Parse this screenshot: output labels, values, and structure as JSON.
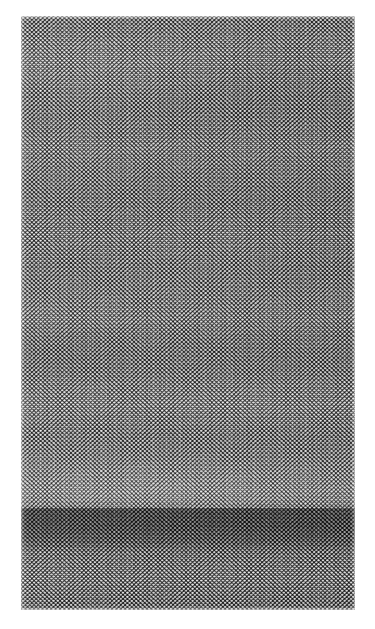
{
  "page": {
    "background_color": "#ffffff",
    "width": 375,
    "height": 629
  },
  "image_plate": {
    "name": "mesh-fabric-texture",
    "description": "Grayscale photographic scan of a dense woven mesh / netting fabric",
    "subject": "woven mesh netting",
    "color_mode": "grayscale",
    "bounds": {
      "x": 21,
      "y": 16,
      "width": 334,
      "height": 594
    },
    "margins": {
      "left": 21,
      "top": 16,
      "right": 20,
      "bottom": 19
    },
    "palette": {
      "thread_dark": "#3a3a3a",
      "cell_light": "#e8e8e8",
      "mid_tone": "#8e8e8e",
      "shadow_band": "#5a5a5a",
      "paper": "#ffffff"
    },
    "texture": {
      "pattern": "staggered circular cells on crossing thread lattice",
      "cell_pitch_px": 4.35,
      "cell_diameter_px": 3.4,
      "rows_estimate": 147,
      "columns_estimate": 77,
      "weave_angle_deg": 68
    },
    "tonal_regions": [
      {
        "name": "upper-field",
        "y_start": 16,
        "y_end": 470,
        "tone": "mid-gray",
        "note": "even mid-gray with faint horizontal banding"
      },
      {
        "name": "bright-band",
        "y_start": 470,
        "y_end": 508,
        "tone": "light",
        "note": "highlight across full width"
      },
      {
        "name": "shadow-step",
        "y_start": 508,
        "y_end": 552,
        "tone": "dark",
        "note": "abrupt darker horizontal band"
      },
      {
        "name": "lower-field",
        "y_start": 552,
        "y_end": 610,
        "tone": "mid-dark",
        "note": "slightly lighter than shadow step"
      }
    ]
  },
  "annotations": {
    "caption": "",
    "label": ""
  }
}
